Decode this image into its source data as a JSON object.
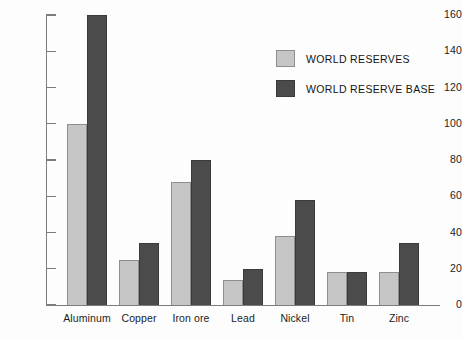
{
  "chart_data": {
    "type": "bar",
    "title": "",
    "xlabel": "",
    "ylabel": "",
    "ylim": [
      0,
      160
    ],
    "yticks": [
      0,
      20,
      40,
      60,
      80,
      100,
      120,
      140,
      160
    ],
    "grid": false,
    "legend_position": "top-right",
    "categories": [
      "Aluminum",
      "Copper",
      "Iron ore",
      "Lead",
      "Nickel",
      "Tin",
      "Zinc"
    ],
    "series": [
      {
        "name": "WORLD RESERVES",
        "color": "#c6c6c6",
        "values": [
          100,
          25,
          68,
          14,
          38,
          18,
          18
        ]
      },
      {
        "name": "WORLD RESERVE BASE",
        "color": "#4b4b4b",
        "values": [
          160,
          34,
          80,
          20,
          58,
          18,
          34
        ]
      }
    ]
  },
  "legend": {
    "items": [
      {
        "label": "WORLD RESERVES",
        "swatch": "light"
      },
      {
        "label": "WORLD RESERVE BASE",
        "swatch": "dark"
      }
    ]
  },
  "axis": {
    "y_tick_labels": [
      "160",
      "140",
      "120",
      "100",
      "80",
      "60",
      "40",
      "20",
      "0"
    ]
  }
}
